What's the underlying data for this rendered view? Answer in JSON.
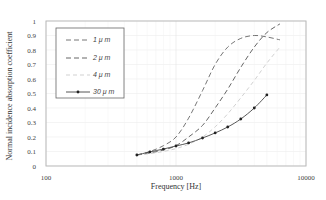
{
  "chart_data": {
    "type": "line",
    "title": "",
    "xlabel": "Frequency [Hz]",
    "ylabel": "Normal incidence absorption coefficient",
    "xscale": "log",
    "xlim": [
      100,
      10000
    ],
    "ylim": [
      0,
      1
    ],
    "x_ticks": [
      "100",
      "1000",
      "10000"
    ],
    "y_ticks": [
      "0",
      "0.1",
      "0.2",
      "0.3",
      "0.4",
      "0.5",
      "0.6",
      "0.7",
      "0.8",
      "0.9",
      "1"
    ],
    "grid": true,
    "legend_position": "upper left",
    "x": [
      500,
      630,
      800,
      1000,
      1250,
      1600,
      2000,
      2500,
      3150,
      4000,
      5000,
      6300
    ],
    "series": [
      {
        "name": "1 μ m",
        "style": "dashed",
        "color": "#666666",
        "marker": "none",
        "values": [
          0.076,
          0.1,
          0.14,
          0.2,
          0.33,
          0.52,
          0.7,
          0.82,
          0.88,
          0.9,
          0.89,
          0.87
        ]
      },
      {
        "name": "2 μ m",
        "style": "dashed",
        "color": "#555555",
        "marker": "none",
        "values": [
          0.076,
          0.09,
          0.11,
          0.14,
          0.2,
          0.28,
          0.4,
          0.53,
          0.68,
          0.82,
          0.92,
          0.98
        ]
      },
      {
        "name": "4 μ m",
        "style": "dashed",
        "color": "#cccccc",
        "marker": "none",
        "values": [
          0.076,
          0.085,
          0.1,
          0.12,
          0.15,
          0.2,
          0.27,
          0.36,
          0.47,
          0.59,
          0.71,
          0.82
        ]
      },
      {
        "name": "30 μ m",
        "style": "solid",
        "color": "#444444",
        "marker": "circle",
        "x": [
          500,
          630,
          800,
          1000,
          1250,
          1600,
          2000,
          2500,
          3150,
          4000,
          5000
        ],
        "values": [
          0.076,
          0.097,
          0.117,
          0.138,
          0.159,
          0.193,
          0.228,
          0.269,
          0.324,
          0.4,
          0.49
        ]
      }
    ]
  },
  "legend": {
    "items": [
      {
        "label": "1 μ m"
      },
      {
        "label": "2 μ m"
      },
      {
        "label": "4 μ m"
      },
      {
        "label": "30 μ m"
      }
    ]
  }
}
